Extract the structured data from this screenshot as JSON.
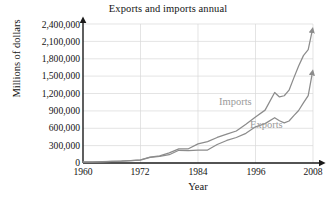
{
  "chart_data": {
    "type": "line",
    "title": "Exports and imports annual",
    "xlabel": "Year",
    "ylabel": "Millions of dollars",
    "xlim": [
      1960,
      2008
    ],
    "ylim": [
      0,
      2400000
    ],
    "grid": true,
    "legend_position": "inline-annotation",
    "x_ticks": [
      1960,
      1972,
      1984,
      1996,
      2008
    ],
    "x_tick_labels": [
      "1960",
      "1972",
      "1984",
      "1996",
      "2008"
    ],
    "y_ticks": [
      0,
      300000,
      600000,
      900000,
      1200000,
      1500000,
      1800000,
      2100000,
      2400000
    ],
    "y_tick_labels": [
      "0",
      "300,000",
      "600,000",
      "900,000",
      "1,200,000",
      "1,500,000",
      "1,800,000",
      "2,100,000",
      "2,400,000"
    ],
    "x": [
      1960,
      1962,
      1964,
      1966,
      1968,
      1970,
      1972,
      1974,
      1976,
      1978,
      1980,
      1982,
      1984,
      1986,
      1988,
      1990,
      1992,
      1994,
      1996,
      1998,
      2000,
      2001,
      2002,
      2003,
      2004,
      2005,
      2006,
      2007,
      2008
    ],
    "series": [
      {
        "name": "Imports",
        "color": "#8c8c8c",
        "values": [
          15000,
          17000,
          20000,
          26000,
          33000,
          40000,
          56000,
          103000,
          124000,
          176000,
          245000,
          245000,
          330000,
          370000,
          441000,
          498000,
          553000,
          669000,
          795000,
          913000,
          1218000,
          1141000,
          1161000,
          1257000,
          1470000,
          1673000,
          1854000,
          1957000,
          2350000
        ]
      },
      {
        "name": "Exports",
        "color": "#8c8c8c",
        "values": [
          19000,
          21000,
          25000,
          29000,
          34000,
          43000,
          49000,
          98000,
          115000,
          143000,
          220000,
          212000,
          224000,
          224000,
          320000,
          389000,
          440000,
          512000,
          625000,
          680000,
          782000,
          729000,
          693000,
          725000,
          819000,
          907000,
          1037000,
          1163000,
          1620000
        ]
      }
    ],
    "annotations": [
      {
        "text": "Imports",
        "x": 1993,
        "y": 1120000
      },
      {
        "text": "Exports",
        "x": 2000,
        "y": 680000
      }
    ]
  },
  "axes": {
    "x_axis_name": "x-axis",
    "y_axis_name": "y-axis"
  }
}
